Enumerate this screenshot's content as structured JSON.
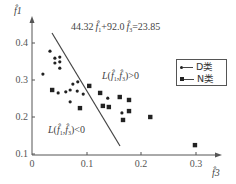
{
  "chart_data": {
    "type": "scatter",
    "title": "",
    "xlabel": "f̂3",
    "ylabel": "f̂1",
    "xlim": [
      0,
      0.33
    ],
    "ylim": [
      0.1,
      0.43
    ],
    "x_ticks": [
      "0",
      "0.1",
      "0.2",
      "0.3"
    ],
    "y_ticks": [
      "0.1",
      "0.2",
      "0.3",
      "0.4"
    ],
    "grid": false,
    "legend_position": "upper right",
    "series": [
      {
        "name": "D类",
        "marker": "circle",
        "points": [
          [
            0.033,
            0.378
          ],
          [
            0.042,
            0.359
          ],
          [
            0.051,
            0.362
          ],
          [
            0.042,
            0.346
          ],
          [
            0.051,
            0.349
          ],
          [
            0.051,
            0.332
          ],
          [
            0.02,
            0.316
          ],
          [
            0.048,
            0.265
          ],
          [
            0.062,
            0.268
          ],
          [
            0.07,
            0.273
          ],
          [
            0.075,
            0.289
          ],
          [
            0.084,
            0.295
          ],
          [
            0.083,
            0.27
          ],
          [
            0.094,
            0.262
          ],
          [
            0.07,
            0.241
          ],
          [
            0.139,
            0.251
          ],
          [
            0.165,
            0.211
          ]
        ]
      },
      {
        "name": "N类",
        "marker": "square",
        "points": [
          [
            0.037,
            0.273
          ],
          [
            0.088,
            0.224
          ],
          [
            0.105,
            0.284
          ],
          [
            0.125,
            0.265
          ],
          [
            0.161,
            0.254
          ],
          [
            0.178,
            0.246
          ],
          [
            0.13,
            0.23
          ],
          [
            0.141,
            0.227
          ],
          [
            0.178,
            0.216
          ],
          [
            0.167,
            0.192
          ],
          [
            0.217,
            0.2
          ],
          [
            0.299,
            0.124
          ]
        ]
      }
    ],
    "decision_line": {
      "equation": "44.32 f̂1 + 92.0 f̂3 = 23.85",
      "from": [
        0.037,
        0.41
      ],
      "to": [
        0.161,
        0.106
      ]
    },
    "annotations": [
      {
        "text": "44.32 f̂1+92.0 f̂3=23.85",
        "position": "top, right of line"
      },
      {
        "text": "L(f̂1,f̂3)>0",
        "position": "right of line"
      },
      {
        "text": "L(f̂1,f̂3)<0",
        "position": "lower left of line"
      }
    ]
  },
  "labels": {
    "y_axis": "f̂1",
    "x_axis": "f̂3",
    "equation": "44.32",
    "equation_mid": "+92.0",
    "equation_end": "=23.85",
    "region_pos": ">0",
    "region_neg": "<0",
    "L": "L(",
    "comma": ",",
    "close": ")",
    "f1": "f̂",
    "sub1": "1",
    "sub3": "3",
    "tick_x0": "0",
    "tick_x1": "0.1",
    "tick_x2": "0.2",
    "tick_x3": "0.3",
    "tick_y1": "0.1",
    "tick_y2": "0.2",
    "tick_y3": "0.3",
    "tick_y4": "0.4"
  },
  "legend": {
    "items": [
      {
        "label": "D类",
        "marker": "circle"
      },
      {
        "label": "N类",
        "marker": "square"
      }
    ]
  },
  "colors": {
    "axis": "#555555",
    "marker": "#222222",
    "line": "#444444",
    "text": "#444444"
  }
}
